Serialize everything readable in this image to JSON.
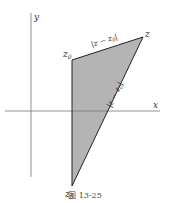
{
  "diagram": {
    "axes": {
      "x_label": "x",
      "y_label": "y"
    },
    "points": {
      "z0_top": "z",
      "z0_top_sub": "0",
      "z": "z",
      "z0_bottom": "z",
      "z0_bottom_sub": "0"
    },
    "edge_labels": {
      "top_edge": "|z − z",
      "top_edge_sub": "0",
      "top_edge_end": "|",
      "diagonal_edge": "|z − z",
      "diagonal_edge_sub": "0",
      "diagonal_edge_end": "|"
    },
    "fill_color": "#b4b4b4",
    "caption": "图 13-25"
  }
}
